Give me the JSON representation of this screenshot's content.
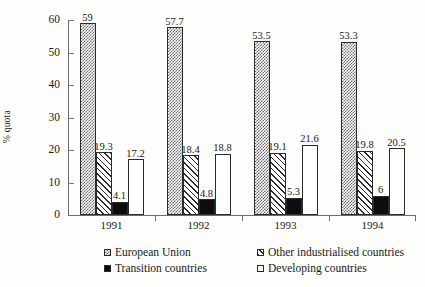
{
  "chart_data": {
    "type": "bar",
    "title": "",
    "subtitle": "",
    "xlabel": "",
    "ylabel": "% quota",
    "categories": [
      "1991",
      "1992",
      "1993",
      "1994"
    ],
    "ylim": [
      0,
      60
    ],
    "yticks": [
      0,
      10,
      20,
      30,
      40,
      50,
      60
    ],
    "grid": false,
    "legend_position": "bottom",
    "data_labels": true,
    "series": [
      {
        "name": "European Union",
        "pattern": "stipple-gray",
        "color": "#6b6b6b",
        "values": [
          59,
          57.7,
          53.5,
          53.3
        ],
        "labels": [
          "59",
          "57.7",
          "53.5",
          "53.3"
        ]
      },
      {
        "name": "Other industrialised countries",
        "pattern": "diagonal-hatch",
        "color": "#2b2b2b",
        "values": [
          19.3,
          18.4,
          19.1,
          19.8
        ],
        "labels": [
          "19.3",
          "18.4",
          "19.1",
          "19.8"
        ]
      },
      {
        "name": "Transition countries",
        "pattern": "solid-black",
        "color": "#0d0d0d",
        "values": [
          4.1,
          4.8,
          5.3,
          6
        ],
        "labels": [
          "4.1",
          "4.8",
          "5.3",
          "6"
        ]
      },
      {
        "name": "Developing countries",
        "pattern": "open-white",
        "color": "#ffffff",
        "values": [
          17.2,
          18.8,
          21.6,
          20.5
        ],
        "labels": [
          "17.2",
          "18.8",
          "21.6",
          "20.5"
        ]
      }
    ]
  },
  "axis": {
    "y_title": "% quota",
    "y_tick_labels": [
      "0",
      "10",
      "20",
      "30",
      "40",
      "50",
      "60"
    ],
    "x_tick_labels": [
      "1991",
      "1992",
      "1993",
      "1994"
    ]
  },
  "legend": {
    "entries": [
      {
        "label": "European Union"
      },
      {
        "label": "Other industrialised countries"
      },
      {
        "label": "Transition countries"
      },
      {
        "label": "Developing countries"
      }
    ]
  }
}
